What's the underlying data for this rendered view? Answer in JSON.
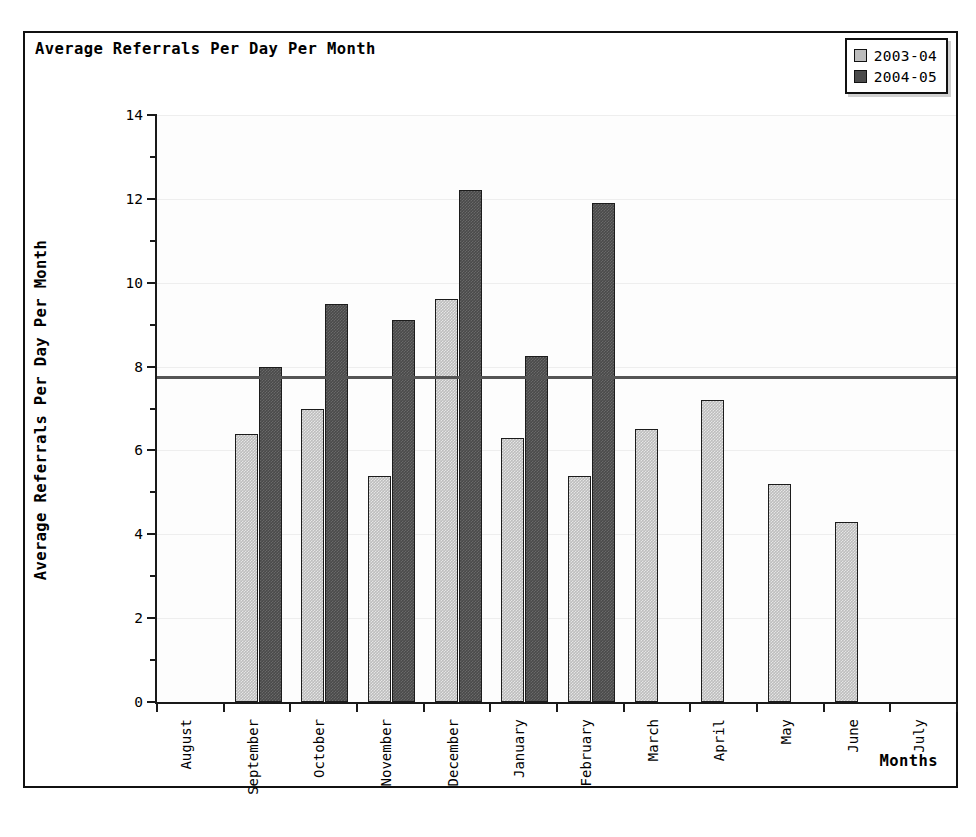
{
  "chart_data": {
    "type": "bar",
    "title": "Average Referrals Per Day Per Month",
    "xlabel": "Months",
    "ylabel": "Average Referrals Per Day Per Month",
    "categories": [
      "August",
      "September",
      "October",
      "November",
      "December",
      "January",
      "February",
      "March",
      "April",
      "May",
      "June",
      "July"
    ],
    "series": [
      {
        "name": "2003-04",
        "color": "#bdbdbd",
        "values": [
          null,
          6.4,
          7.0,
          5.4,
          9.6,
          6.3,
          5.4,
          6.5,
          7.2,
          5.2,
          4.3,
          null
        ]
      },
      {
        "name": "2004-05",
        "color": "#4a4a4a",
        "values": [
          null,
          8.0,
          9.5,
          9.1,
          12.2,
          8.25,
          11.9,
          null,
          null,
          null,
          null,
          null
        ]
      }
    ],
    "ylim": [
      0,
      14
    ],
    "ytick_labels": [
      "0",
      "2",
      "4",
      "6",
      "8",
      "10",
      "12",
      "14"
    ],
    "ytick_values": [
      0,
      2,
      4,
      6,
      8,
      10,
      12,
      14
    ],
    "yminor_values": [
      1,
      3,
      5,
      7,
      9,
      11,
      13
    ],
    "grid": true,
    "legend_position": "top-right",
    "reference_line": {
      "value": 7.75,
      "color": "#555555"
    }
  },
  "legend": {
    "items": [
      {
        "label": "2003-04",
        "color": "#bdbdbd"
      },
      {
        "label": "2004-05",
        "color": "#4a4a4a"
      }
    ]
  }
}
